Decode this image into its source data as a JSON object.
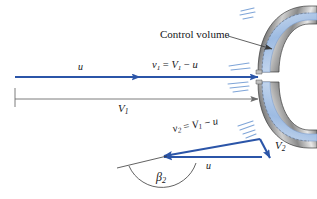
{
  "figure": {
    "type": "velocity-vector-diagram",
    "background_color": "#ffffff"
  },
  "colors": {
    "vector_blue": "#2B55A8",
    "arrow_blue": "#2B55A8",
    "water_light": "#AFC8E8",
    "water_mid": "#8FB0DC",
    "metal_dark": "#4A4A4A",
    "metal_light": "#D8D8D8",
    "dimension_gray": "#6E6E6E",
    "leader_gray": "#4A4A4A",
    "hatch_blue": "#7FA5D8",
    "text": "#15161a"
  },
  "labels": {
    "control_volume": "Control volume",
    "u_top": "u",
    "u_bottom": "u",
    "v1_relation": {
      "sym": "v",
      "sub": "1",
      "eq": "=",
      "rhs_sym": "V",
      "rhs_sub": "1",
      "minus": "−",
      "rhs_term": "u",
      "full": "v1 = V1 − u"
    },
    "v2_relation": {
      "sym": "v",
      "sub": "2",
      "eq": "=",
      "rhs_sym": "V",
      "rhs_sub": "1",
      "minus": "−",
      "rhs_term": "u",
      "full": "v2 = V1 − u"
    },
    "V1": {
      "sym": "V",
      "sub": "1"
    },
    "V2": {
      "sym": "V",
      "sub": "2"
    },
    "beta2": {
      "sym": "β",
      "sub": "2"
    }
  },
  "geometry": {
    "jet_line": {
      "x1": 15,
      "y1": 77,
      "x2": 258,
      "y2": 77
    },
    "u_arrow_tip_x": 140,
    "dimension_line": {
      "x1": 15,
      "y1": 99,
      "x2": 258,
      "y2": 99
    },
    "v2_vector": {
      "x1": 260,
      "y1": 139,
      "x2": 162,
      "y2": 157
    },
    "u_vector_bottom": {
      "x1": 260,
      "y1": 157,
      "x2": 162,
      "y2": 157
    },
    "V2_vector": {
      "x1": 260,
      "y1": 139,
      "x2": 272,
      "y2": 160
    },
    "beta_arc_center": {
      "x": 162,
      "y": 157
    },
    "beta_arc_radius": 36,
    "reference_line": {
      "x1": 118,
      "y1": 167,
      "x2": 168,
      "y2": 155
    }
  },
  "annotations": {
    "hatch_groups": [
      {
        "name": "upper-inlet-hatch",
        "count": 3
      },
      {
        "name": "jet-inlet-hatch",
        "count": 5
      },
      {
        "name": "lower-outlet-hatch",
        "count": 4
      }
    ]
  }
}
